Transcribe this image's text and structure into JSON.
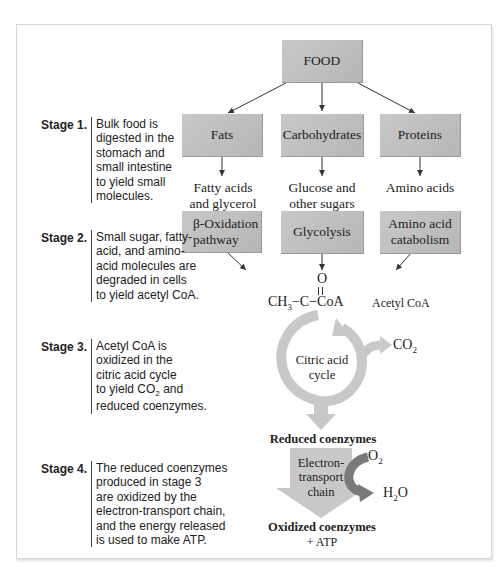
{
  "diagram": {
    "top_node": "FOOD",
    "stage1_boxes": [
      "Fats",
      "Carbohydrates",
      "Proteins"
    ],
    "stage1_products": [
      [
        "Fatty acids",
        "and glycerol"
      ],
      [
        "Glucose and",
        "other sugars"
      ],
      [
        "Amino acids"
      ]
    ],
    "stage2_boxes": [
      [
        "β-Oxidation",
        "pathway"
      ],
      [
        "Glycolysis"
      ],
      [
        "Amino acid",
        "catabolism"
      ]
    ],
    "acetyl": {
      "oxygen": "O",
      "ch3": "CH",
      "ch3_sub": "3",
      "carbon": "C",
      "coa": "CoA",
      "label": "Acetyl CoA"
    },
    "cycle": {
      "line1": "Citric acid",
      "line2": "cycle",
      "co2": "CO",
      "co2_sub": "2"
    },
    "reduced": "Reduced coenzymes",
    "etc": {
      "line1": "Electron-",
      "line2": "transport",
      "line3": "chain",
      "o2": "O",
      "o2_sub": "2",
      "h2o_h": "H",
      "h2o_sub": "2",
      "h2o_o": "O"
    },
    "oxidized": "Oxidized coenzymes",
    "atp": "+ ATP"
  },
  "stages": [
    {
      "label": "Stage 1.",
      "lines": [
        "Bulk food is",
        "digested in the",
        "stomach and",
        "small intestine",
        "to yield small",
        "molecules."
      ]
    },
    {
      "label": "Stage 2.",
      "lines": [
        "Small sugar, fatty-",
        "acid, and amino-",
        "acid molecules are",
        "degraded in cells",
        "to yield acetyl CoA."
      ]
    },
    {
      "label": "Stage 3.",
      "lines": [
        "Acetyl CoA is",
        "oxidized in the",
        "citric acid cycle",
        "to yield CO",
        "reduced coenzymes."
      ],
      "sub": "2",
      "after_sub": " and"
    },
    {
      "label": "Stage 4.",
      "lines": [
        "The reduced coenzymes",
        "produced in stage 3",
        "are oxidized by the",
        "electron-transport chain,",
        "and the energy released",
        "is used to make ATP."
      ]
    }
  ],
  "colors": {
    "box": "#bcbcbc",
    "arrow_light": "#c8c8c8",
    "arrow_dark": "#7a7a7a"
  }
}
